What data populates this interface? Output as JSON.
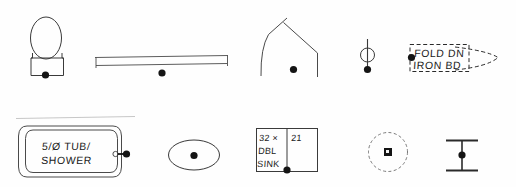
{
  "sheet": {
    "kind": "architectural-plan-legend",
    "background_color": "#fefefe",
    "ink_color": "#1a1a1a",
    "line_color": "#3a3a3a",
    "width": 516,
    "height": 187
  },
  "annotations": {
    "ironing_board_line1": "FOLD DN",
    "ironing_board_line2": "IRON BD",
    "tub_line1": "5/Ø TUB/",
    "tub_line2": "SHOWER",
    "sink_size": "32 ×",
    "sink_depth": "21",
    "sink_line2": "DBL",
    "sink_line3": "SINK"
  },
  "symbols": [
    {
      "id": "toilet",
      "name": "toilet-symbol",
      "row": 1,
      "description": "oval bowl with rectangular tank and node dot"
    },
    {
      "id": "counter",
      "name": "counter-shelf-symbol",
      "row": 1,
      "description": "long horizontal counter with end ticks and node dot"
    },
    {
      "id": "corner-shower",
      "name": "corner-shower-symbol",
      "row": 1,
      "description": "angled curved corner enclosure with node dot"
    },
    {
      "id": "pipe-riser",
      "name": "pipe-riser-symbol",
      "row": 1,
      "description": "vertical line through small circle with node dot"
    },
    {
      "id": "ironing-board",
      "name": "fold-down-ironing-board-symbol",
      "row": 1,
      "description": "dashed rectangle with tapered dashed board and node dot"
    },
    {
      "id": "tub-shower",
      "name": "tub-shower-symbol",
      "row": 2,
      "description": "rounded rectangle tub with drain circle and node dot"
    },
    {
      "id": "lavatory",
      "name": "oval-lavatory-symbol",
      "row": 2,
      "description": "oval basin with center node dot"
    },
    {
      "id": "double-sink",
      "name": "double-sink-symbol",
      "row": 2,
      "description": "two-bay rectangular sink with dimension text and node dot"
    },
    {
      "id": "ceiling-fixture",
      "name": "ceiling-fixture-symbol",
      "row": 2,
      "description": "dashed circle with small solid square at center"
    },
    {
      "id": "column",
      "name": "column-beam-symbol",
      "row": 2,
      "description": "I-shaped beam section with node dot"
    }
  ]
}
